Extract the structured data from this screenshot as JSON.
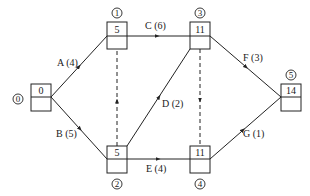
{
  "diagram": {
    "type": "activity-on-arrow network (double-code)",
    "colors": {
      "stroke": "#222222",
      "background": "#ffffff"
    },
    "nodes": [
      {
        "id": "0",
        "label": "0",
        "value": "0"
      },
      {
        "id": "1",
        "label": "1",
        "value": "5"
      },
      {
        "id": "2",
        "label": "2",
        "value": "5"
      },
      {
        "id": "3",
        "label": "3",
        "value": "11"
      },
      {
        "id": "4",
        "label": "4",
        "value": "11"
      },
      {
        "id": "5",
        "label": "5",
        "value": "14"
      }
    ],
    "edges": [
      {
        "from": "0",
        "to": "1",
        "label": "A (4)",
        "activity": "A",
        "duration": 4,
        "dashed": false
      },
      {
        "from": "0",
        "to": "2",
        "label": "B (5)",
        "activity": "B",
        "duration": 5,
        "dashed": false
      },
      {
        "from": "1",
        "to": "3",
        "label": "C (6)",
        "activity": "C",
        "duration": 6,
        "dashed": false
      },
      {
        "from": "2",
        "to": "3",
        "label": "D (2)",
        "activity": "D",
        "duration": 2,
        "dashed": false
      },
      {
        "from": "2",
        "to": "4",
        "label": "E (4)",
        "activity": "E",
        "duration": 4,
        "dashed": false
      },
      {
        "from": "3",
        "to": "5",
        "label": "F (3)",
        "activity": "F",
        "duration": 3,
        "dashed": false
      },
      {
        "from": "4",
        "to": "5",
        "label": "G (1)",
        "activity": "G",
        "duration": 1,
        "dashed": false
      },
      {
        "from": "2",
        "to": "1",
        "label": "",
        "activity": "dummy",
        "duration": 0,
        "dashed": true
      },
      {
        "from": "3",
        "to": "4",
        "label": "",
        "activity": "dummy",
        "duration": 0,
        "dashed": true
      }
    ]
  }
}
